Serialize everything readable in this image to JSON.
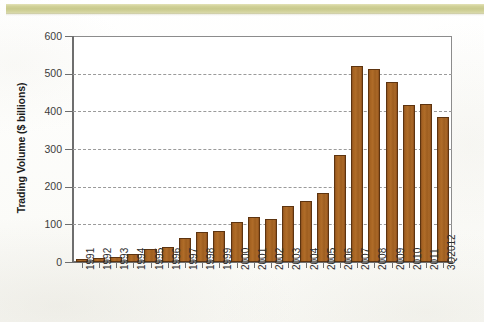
{
  "page": {
    "band_color": "#c8c989",
    "background_color": "#ffffff"
  },
  "chart_data": {
    "type": "bar",
    "title": "",
    "xlabel": "",
    "ylabel": "Trading Volume ($ billions)",
    "ylim": [
      0,
      600
    ],
    "ytick_step": 100,
    "yticks": [
      "600",
      "500",
      "400",
      "300",
      "200",
      "100",
      "0"
    ],
    "grid": "horizontal-dashed",
    "legend": "none",
    "bar_color": "#a5611f",
    "bar_edge_color": "#5d3410",
    "categories": [
      "1991",
      "1992",
      "1993",
      "1994",
      "1995",
      "1996",
      "1997",
      "1998",
      "1999",
      "2000",
      "2001",
      "2002",
      "2003",
      "2004",
      "2005",
      "2006",
      "2007",
      "2008",
      "2009",
      "2010",
      "2011",
      "3Q2012"
    ],
    "values": [
      8,
      11,
      14,
      22,
      34,
      41,
      63,
      79,
      83,
      106,
      119,
      115,
      148,
      161,
      183,
      284,
      521,
      512,
      477,
      417,
      420,
      385
    ],
    "series": [
      {
        "name": "Trading Volume",
        "values": [
          8,
          11,
          14,
          22,
          34,
          41,
          63,
          79,
          83,
          106,
          119,
          115,
          148,
          161,
          183,
          284,
          521,
          512,
          477,
          417,
          420,
          385
        ]
      }
    ]
  }
}
